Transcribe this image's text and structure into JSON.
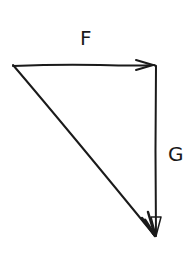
{
  "diagram": {
    "type": "vector-triangle",
    "stroke_color": "#1a1a1a",
    "background": "#ffffff",
    "vectors": [
      {
        "name": "F",
        "label": "F",
        "from": [
          13,
          65
        ],
        "to": [
          154,
          65
        ]
      },
      {
        "name": "G",
        "label": "G",
        "from": [
          155,
          66
        ],
        "to": [
          156,
          236
        ]
      },
      {
        "name": "resultant",
        "label": "",
        "from": [
          13,
          65
        ],
        "to": [
          155,
          236
        ]
      }
    ],
    "labels": {
      "f": "F",
      "g": "G"
    }
  }
}
